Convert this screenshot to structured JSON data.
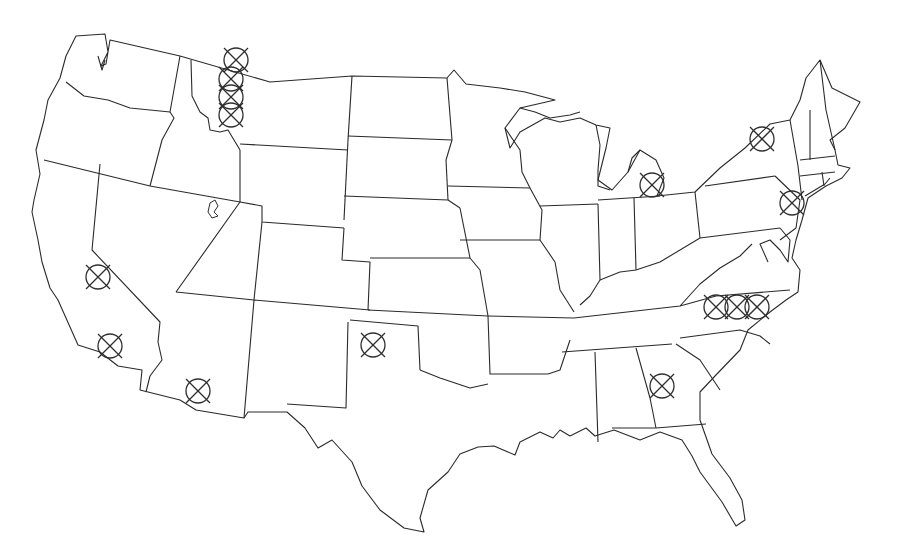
{
  "map": {
    "type": "outline-map",
    "region": "Contiguous United States",
    "style": "black state outlines on white background",
    "colors": {
      "background": "#ffffff",
      "outline": "#2a2a2a",
      "marker": "#2f2f2f"
    },
    "marker_symbol": "circled-x-icon",
    "marker_radius_px": 12,
    "markers": [
      {
        "id": 1,
        "state": "Montana (NW, near Idaho border)",
        "x": 236,
        "y": 60
      },
      {
        "id": 2,
        "state": "Montana / Idaho panhandle",
        "x": 231,
        "y": 79
      },
      {
        "id": 3,
        "state": "Montana / Idaho panhandle",
        "x": 231,
        "y": 97
      },
      {
        "id": 4,
        "state": "Montana / Idaho panhandle",
        "x": 231,
        "y": 115
      },
      {
        "id": 5,
        "state": "California (central)",
        "x": 98,
        "y": 277
      },
      {
        "id": 6,
        "state": "California (south coast)",
        "x": 110,
        "y": 346
      },
      {
        "id": 7,
        "state": "Arizona (south)",
        "x": 198,
        "y": 391
      },
      {
        "id": 8,
        "state": "Oklahoma panhandle / NW Texas",
        "x": 373,
        "y": 345
      },
      {
        "id": 9,
        "state": "Georgia",
        "x": 662,
        "y": 386
      },
      {
        "id": 10,
        "state": "North Carolina",
        "x": 716,
        "y": 307
      },
      {
        "id": 11,
        "state": "North Carolina",
        "x": 737,
        "y": 307
      },
      {
        "id": 12,
        "state": "North Carolina",
        "x": 757,
        "y": 307
      },
      {
        "id": 13,
        "state": "Michigan",
        "x": 652,
        "y": 185
      },
      {
        "id": 14,
        "state": "New York (north)",
        "x": 762,
        "y": 139
      },
      {
        "id": 15,
        "state": "New York / New Jersey",
        "x": 792,
        "y": 203
      }
    ],
    "marker_count": 15
  }
}
